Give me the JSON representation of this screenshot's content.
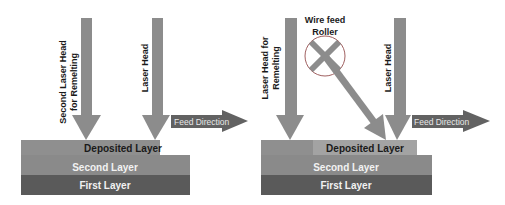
{
  "colors": {
    "arrow": "#8c8c8c",
    "deposited_layer": "#8f8f8f",
    "deposited_layer_light": "#a3a3a3",
    "second_layer": "#8a8a8a",
    "first_layer": "#5a5a5a",
    "feed_arrow": "#626262",
    "roller_outline": "#a06060",
    "dark_text": "#1a1a1a",
    "light_text": "#f2f2f2"
  },
  "left_panel": {
    "second_laser_head_line1": "Second Laser Head",
    "second_laser_head_line2": "for Remelting",
    "laser_head": "Laser Head",
    "feed_direction": "Feed Direction",
    "deposited_layer": "Deposited Layer",
    "second_layer": "Second Layer",
    "first_layer": "First Layer"
  },
  "right_panel": {
    "laser_head_remelting_line1": "Laser Head for",
    "laser_head_remelting_line2": "Remelting",
    "wire_feed_line1": "Wire feed",
    "wire_feed_line2": "Roller",
    "laser_head": "Laser Head",
    "feed_direction": "Feed Direction",
    "deposited_layer": "Deposited Layer",
    "second_layer": "Second Layer",
    "first_layer": "First Layer"
  }
}
